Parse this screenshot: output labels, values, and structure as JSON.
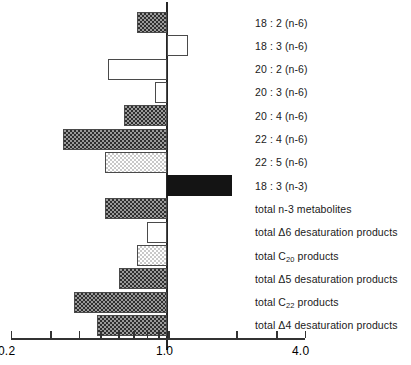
{
  "chart_data": {
    "type": "bar",
    "orientation": "horizontal",
    "title": "",
    "subtitle": "",
    "xlabel": "",
    "ylabel": "",
    "scale": "log",
    "reference_value": 1.0,
    "xlim": [
      0.2,
      4.0
    ],
    "grid": false,
    "legend": null,
    "axis": {
      "tick_labels": [
        "0.2",
        "1.0",
        "4.0"
      ],
      "tick_label_values": [
        0.2,
        1.0,
        4.0
      ],
      "minor_tick_values": [
        0.3,
        0.4,
        0.5,
        0.6,
        0.7,
        0.8,
        0.9,
        2.0,
        3.0
      ],
      "axis_min_value": 0.2,
      "axis_max_value": 4.0
    },
    "categories": [
      "18 : 2 (n-6)",
      "18 : 3 (n-6)",
      "20 : 2 (n-6)",
      "20 : 3 (n-6)",
      "20 : 4 (n-6)",
      "22 : 4 (n-6)",
      "22 : 5 (n-6)",
      "18 : 3 (n-3)",
      "total n-3 metabolites",
      "total Δ6 desaturation products",
      "total C20 products",
      "total Δ5 desaturation products",
      "total C22 products",
      "total Δ4 desaturation products"
    ],
    "values": [
      0.72,
      1.22,
      0.54,
      0.87,
      0.63,
      0.34,
      0.52,
      1.9,
      0.52,
      0.8,
      0.72,
      0.6,
      0.38,
      0.48
    ],
    "bars": [
      {
        "label": "18 : 2 (n-6)",
        "label_html": "18 : 2 (n-6)",
        "value": 0.72,
        "direction": "below",
        "fill": "checker"
      },
      {
        "label": "18 : 3 (n-6)",
        "label_html": "18 : 3 (n-6)",
        "value": 1.22,
        "direction": "above",
        "fill": "open"
      },
      {
        "label": "20 : 2 (n-6)",
        "label_html": "20 : 2 (n-6)",
        "value": 0.54,
        "direction": "below",
        "fill": "open"
      },
      {
        "label": "20 : 3 (n-6)",
        "label_html": "20 : 3 (n-6)",
        "value": 0.87,
        "direction": "below",
        "fill": "open"
      },
      {
        "label": "20 : 4 (n-6)",
        "label_html": "20 : 4 (n-6)",
        "value": 0.63,
        "direction": "below",
        "fill": "checker"
      },
      {
        "label": "22 : 4 (n-6)",
        "label_html": "22 : 4 (n-6)",
        "value": 0.34,
        "direction": "below",
        "fill": "checker"
      },
      {
        "label": "22 : 5 (n-6)",
        "label_html": "22 : 5 (n-6)",
        "value": 0.52,
        "direction": "below",
        "fill": "dots"
      },
      {
        "label": "18 : 3 (n-3)",
        "label_html": "18 : 3 (n-3)",
        "value": 1.9,
        "direction": "above",
        "fill": "solid"
      },
      {
        "label": "total n-3 metabolites",
        "label_html": "total n-3 metabolites",
        "value": 0.52,
        "direction": "below",
        "fill": "checker"
      },
      {
        "label": "total Δ6 desaturation products",
        "label_html": "total Δ6 desaturation products",
        "value": 0.8,
        "direction": "below",
        "fill": "open"
      },
      {
        "label": "total C20 products",
        "label_html": "total C<sub>20</sub> products",
        "value": 0.72,
        "direction": "below",
        "fill": "dots"
      },
      {
        "label": "total Δ5 desaturation products",
        "label_html": "total Δ5 desaturation products",
        "value": 0.6,
        "direction": "below",
        "fill": "checker"
      },
      {
        "label": "total C22 products",
        "label_html": "total C<sub>22</sub> products",
        "value": 0.38,
        "direction": "below",
        "fill": "checker"
      },
      {
        "label": "total Δ4 desaturation products",
        "label_html": "total Δ4 desaturation products",
        "value": 0.48,
        "direction": "below",
        "fill": "checker"
      }
    ],
    "colors": {
      "checker_dark": "#2f2f2f",
      "checker_light": "#9a9a9a",
      "dots_light": "#c9c9c9",
      "solid": "#141414",
      "outline": "#4a4a4a",
      "axis": "#333333",
      "background": "#ffffff"
    }
  }
}
